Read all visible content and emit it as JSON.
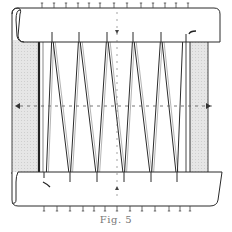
{
  "figure": {
    "caption": "Fig. 5",
    "colors": {
      "line": "#2a2a2a",
      "shade": "#e2e2e2",
      "background": "#ffffff",
      "dash": "#555555"
    },
    "top_roller": {
      "x": 12,
      "y": 8,
      "w": 208,
      "h": 34
    },
    "bottom_roller": {
      "x": 12,
      "y": 172,
      "w": 210,
      "h": 34
    },
    "left_bar": {
      "x": 12,
      "y": 40,
      "w": 26,
      "h": 132
    },
    "right_bar": {
      "x": 190,
      "y": 40,
      "w": 18,
      "h": 132
    },
    "zigzag_top_x": [
      52,
      79,
      107,
      133,
      161
    ],
    "zigzag_bottom_x": [
      70,
      97,
      124,
      151,
      177
    ],
    "zigzag_top_y": 32,
    "zigzag_bottom_y": 182,
    "top_ticks_x": [
      42,
      54,
      66,
      78,
      89,
      100,
      114,
      127,
      141,
      153,
      165,
      176,
      188
    ],
    "bottom_ticks_x": [
      44,
      57,
      70,
      83,
      94,
      105,
      117,
      130,
      142,
      155,
      169,
      180,
      190
    ],
    "center_line_y": 106,
    "center_line_x": 117
  }
}
